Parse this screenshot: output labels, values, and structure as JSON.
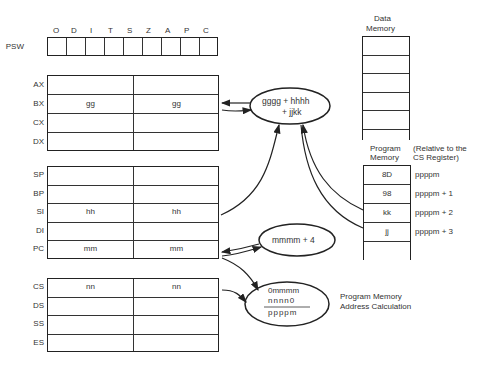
{
  "psw": {
    "label": "PSW",
    "flags": [
      "O",
      "D",
      "I",
      "T",
      "S",
      "Z",
      "A",
      "P",
      "C"
    ]
  },
  "general_registers": [
    {
      "name": "AX",
      "high": "",
      "low": ""
    },
    {
      "name": "BX",
      "high": "gg",
      "low": "gg"
    },
    {
      "name": "CX",
      "high": "",
      "low": ""
    },
    {
      "name": "DX",
      "high": "",
      "low": ""
    }
  ],
  "pointer_registers": [
    {
      "name": "SP",
      "high": "",
      "low": ""
    },
    {
      "name": "BP",
      "high": "",
      "low": ""
    },
    {
      "name": "SI",
      "high": "hh",
      "low": "hh"
    },
    {
      "name": "DI",
      "high": "",
      "low": ""
    },
    {
      "name": "PC",
      "high": "mm",
      "low": "mm"
    }
  ],
  "segment_registers": [
    {
      "name": "CS",
      "high": "nn",
      "low": "nn"
    },
    {
      "name": "DS",
      "high": "",
      "low": ""
    },
    {
      "name": "SS",
      "high": "",
      "low": ""
    },
    {
      "name": "ES",
      "high": "",
      "low": ""
    }
  ],
  "ellipses": {
    "sum_line1": "gggg + hhhh",
    "sum_line2": "+ jjkk",
    "pc_inc": "mmmm + 4",
    "addr_line1": "0mmmm",
    "addr_line2": "nnnn0",
    "addr_line3": "ppppm"
  },
  "data_memory": {
    "title_line1": "Data",
    "title_line2": "Memory"
  },
  "program_memory": {
    "title_line1": "Program",
    "title_line2": "Memory",
    "note_line1": "(Relative to the",
    "note_line2": "CS Register)",
    "cells": [
      "8D",
      "98",
      "kk",
      "jj",
      ""
    ],
    "addresses": [
      "ppppm",
      "ppppm + 1",
      "ppppm + 2",
      "ppppm + 3"
    ]
  },
  "address_calc_label": {
    "line1": "Program Memory",
    "line2": "Address Calculation"
  }
}
